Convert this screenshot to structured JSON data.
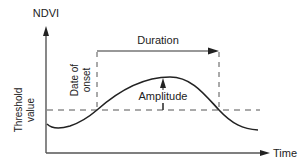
{
  "diagram": {
    "type": "phenology-curve",
    "labels": {
      "y_axis": "NDVI",
      "x_axis": "Time",
      "threshold_line1": "Threshold",
      "threshold_line2": "value",
      "onset_line1": "Date of",
      "onset_line2": "onset",
      "duration": "Duration",
      "amplitude": "Amplitude"
    },
    "colors": {
      "axis": "#555555",
      "curve": "#222222",
      "dashed": "#555555",
      "text": "#222222"
    }
  }
}
